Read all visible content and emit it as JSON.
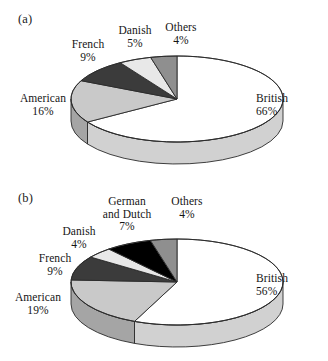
{
  "figure": {
    "panels": [
      {
        "tag": "(a)",
        "chart_data": {
          "type": "pie",
          "title": "(a)",
          "start_angle_deg": 0,
          "direction": "clockwise",
          "three_d": true,
          "labels": [
            "British",
            "American",
            "French",
            "Danish",
            "Others"
          ],
          "values": [
            66,
            16,
            9,
            5,
            4
          ],
          "value_suffix": "%",
          "colors": [
            "#ffffff",
            "#c9c9c9",
            "#3b3b3b",
            "#e8e8e8",
            "#8f8f8f"
          ],
          "legend": "none",
          "slices": [
            {
              "label": "British",
              "value": 66,
              "pct_text": "66%",
              "color": "#ffffff"
            },
            {
              "label": "American",
              "value": 16,
              "pct_text": "16%",
              "color": "#c9c9c9"
            },
            {
              "label": "French",
              "value": 9,
              "pct_text": "9%",
              "color": "#3b3b3b"
            },
            {
              "label": "Danish",
              "value": 5,
              "pct_text": "5%",
              "color": "#e8e8e8"
            },
            {
              "label": "Others",
              "value": 4,
              "pct_text": "4%",
              "color": "#8f8f8f"
            }
          ]
        }
      },
      {
        "tag": "(b)",
        "chart_data": {
          "type": "pie",
          "title": "(b)",
          "start_angle_deg": 0,
          "direction": "clockwise",
          "three_d": true,
          "labels": [
            "British",
            "American",
            "French",
            "Danish",
            "German and Dutch",
            "Others"
          ],
          "values": [
            56,
            19,
            9,
            4,
            7,
            4
          ],
          "value_suffix": "%",
          "colors": [
            "#ffffff",
            "#c9c9c9",
            "#3b3b3b",
            "#e8e8e8",
            "#000000",
            "#8f8f8f"
          ],
          "legend": "none",
          "slices": [
            {
              "label": "British",
              "value": 56,
              "pct_text": "56%",
              "color": "#ffffff"
            },
            {
              "label": "American",
              "value": 19,
              "pct_text": "19%",
              "color": "#c9c9c9"
            },
            {
              "label": "French",
              "value": 9,
              "pct_text": "9%",
              "color": "#3b3b3b"
            },
            {
              "label": "Danish",
              "value": 4,
              "pct_text": "4%",
              "color": "#e8e8e8"
            },
            {
              "label": "German and Dutch",
              "value": 7,
              "pct_text": "7%",
              "color": "#000000",
              "label_line1": "German",
              "label_line2": "and Dutch"
            },
            {
              "label": "Others",
              "value": 4,
              "pct_text": "4%",
              "color": "#8f8f8f"
            }
          ]
        }
      }
    ]
  },
  "chart_data": [
    {
      "type": "pie",
      "title": "(a)",
      "categories": [
        "British",
        "American",
        "French",
        "Danish",
        "Others"
      ],
      "values": [
        66,
        16,
        9,
        5,
        4
      ],
      "units": "percent",
      "colors": [
        "#ffffff",
        "#c9c9c9",
        "#3b3b3b",
        "#e8e8e8",
        "#8f8f8f"
      ],
      "start_angle_deg": 0,
      "direction": "clockwise",
      "three_d": true,
      "legend": "none",
      "grid": false
    },
    {
      "type": "pie",
      "title": "(b)",
      "categories": [
        "British",
        "American",
        "French",
        "Danish",
        "German and Dutch",
        "Others"
      ],
      "values": [
        56,
        19,
        9,
        4,
        7,
        4
      ],
      "units": "percent",
      "colors": [
        "#ffffff",
        "#c9c9c9",
        "#3b3b3b",
        "#e8e8e8",
        "#000000",
        "#8f8f8f"
      ],
      "start_angle_deg": 0,
      "direction": "clockwise",
      "three_d": true,
      "legend": "none",
      "grid": false
    }
  ],
  "panel_a_labels": {
    "british": {
      "name": "British",
      "pct": "66%"
    },
    "american": {
      "name": "American",
      "pct": "16%"
    },
    "french": {
      "name": "French",
      "pct": "9%"
    },
    "danish": {
      "name": "Danish",
      "pct": "5%"
    },
    "others": {
      "name": "Others",
      "pct": "4%"
    }
  },
  "panel_b_labels": {
    "british": {
      "name": "British",
      "pct": "56%"
    },
    "american": {
      "name": "American",
      "pct": "19%"
    },
    "french": {
      "name": "French",
      "pct": "9%"
    },
    "danish": {
      "name": "Danish",
      "pct": "4%"
    },
    "german": {
      "name_line1": "German",
      "name_line2": "and Dutch",
      "pct": "7%"
    },
    "others": {
      "name": "Others",
      "pct": "4%"
    }
  },
  "tags": {
    "a": "(a)",
    "b": "(b)"
  }
}
